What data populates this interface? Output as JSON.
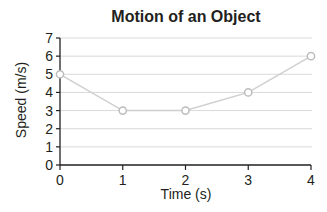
{
  "chart_data": {
    "type": "line",
    "title": "Motion of an Object",
    "xlabel": "Time (s)",
    "ylabel": "Speed (m/s)",
    "x": [
      0,
      1,
      2,
      3,
      4
    ],
    "series": [
      {
        "name": "Speed",
        "values": [
          5,
          3,
          3,
          4,
          6
        ]
      }
    ],
    "xticks": [
      "0",
      "1",
      "2",
      "3",
      "4"
    ],
    "yticks": [
      "0",
      "1",
      "2",
      "3",
      "4",
      "5",
      "6",
      "7"
    ],
    "xlim": [
      0,
      4
    ],
    "ylim": [
      0,
      7
    ],
    "grid": "horizontal",
    "legend": "none",
    "colors": {
      "line": "#cfcfcf",
      "marker_fill": "#ffffff",
      "marker_edge": "#bdbdbd",
      "axis": "#231f20",
      "grid": "#d9d9d9"
    }
  }
}
